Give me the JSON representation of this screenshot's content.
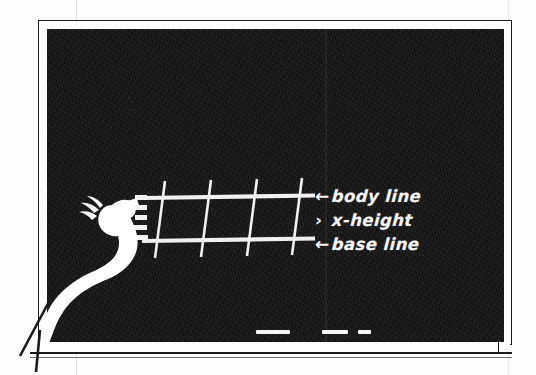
{
  "scene": {
    "title": "Chalkboard lettering guideline demonstration",
    "surface": "blackboard",
    "board_color": "#1a1a1a",
    "chalk_color": "#f2f2f2",
    "frame_color": "#1b1b1b",
    "paper_color": "#fdfdfd"
  },
  "labels": [
    {
      "mark": "←",
      "mark_name": "arrow-left-icon",
      "text": "body line"
    },
    {
      "mark": "›",
      "mark_name": "angle-bracket-icon",
      "text": "x-height"
    },
    {
      "mark": "←",
      "mark_name": "arrow-left-icon",
      "text": "base line"
    }
  ],
  "guidelines": {
    "horizontal": [
      {
        "name": "body-line",
        "x1": 96,
        "y1": 169,
        "x2": 268,
        "y2": 167
      },
      {
        "name": "base-line",
        "x1": 95,
        "y1": 212,
        "x2": 268,
        "y2": 210
      }
    ],
    "vertical": [
      {
        "name": "stem-1",
        "x1": 117,
        "y1": 154,
        "x2": 108,
        "y2": 227
      },
      {
        "name": "stem-2",
        "x1": 163,
        "y1": 153,
        "x2": 154,
        "y2": 226
      },
      {
        "name": "stem-3",
        "x1": 209,
        "y1": 152,
        "x2": 200,
        "y2": 225
      },
      {
        "name": "stem-4",
        "x1": 254,
        "y1": 151,
        "x2": 245,
        "y2": 224
      }
    ],
    "left_marks": [
      {
        "name": "tick-1",
        "x": 90,
        "y": 172,
        "w": 11,
        "h": 5
      },
      {
        "name": "tick-2",
        "x": 88,
        "y": 182,
        "w": 13,
        "h": 5
      },
      {
        "name": "tick-3",
        "x": 90,
        "y": 192,
        "w": 11,
        "h": 5
      },
      {
        "name": "tick-4",
        "x": 88,
        "y": 202,
        "w": 13,
        "h": 5
      }
    ]
  },
  "chalk_sticks": [
    {
      "name": "chalk-long",
      "length": 34
    },
    {
      "name": "chalk-medium",
      "length": 26
    },
    {
      "name": "chalk-short",
      "length": 13
    }
  ]
}
